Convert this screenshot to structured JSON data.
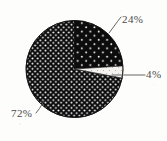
{
  "figure": {
    "background_color": "#fdfdfc",
    "ink_color": "#4a4a4a"
  },
  "chart_data": {
    "type": "pie",
    "title": "",
    "subtitle": "",
    "xlabel": "",
    "ylabel": "",
    "legend_position": "none",
    "grid": false,
    "labels_shown_on_slices": true,
    "label_leader_lines": true,
    "units": "percent",
    "total": 100,
    "start_angle_deg": 0,
    "direction": "clockwise",
    "categories": [
      "24%",
      "4%",
      "72%"
    ],
    "values": [
      24,
      4,
      72
    ],
    "slices": [
      {
        "label": "24%",
        "value": 24,
        "fill": "#0d0d0d",
        "pattern": "sparse-white-dots",
        "start_angle_deg": 0,
        "end_angle_deg": 86.4,
        "label_position": "outside-right-top"
      },
      {
        "label": "4%",
        "value": 4,
        "fill": "#f2f1ee",
        "pattern": "solid-light",
        "start_angle_deg": 86.4,
        "end_angle_deg": 100.8,
        "label_position": "outside-right"
      },
      {
        "label": "72%",
        "value": 72,
        "fill": "#0d0d0d",
        "pattern": "dense-white-dots",
        "start_angle_deg": 100.8,
        "end_angle_deg": 360,
        "label_position": "outside-left-bottom"
      }
    ],
    "geometry": {
      "center_x": 74.5,
      "center_y": 69,
      "radius": 48.5
    }
  },
  "labels": {
    "slice_24": "24%",
    "slice_4": "4%",
    "slice_72": "72%"
  }
}
